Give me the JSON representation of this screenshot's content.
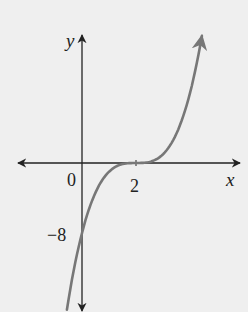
{
  "chart_data": {
    "type": "line",
    "title": "",
    "function": "y = (x - 2)^3",
    "xlabel": "x",
    "ylabel": "y",
    "x_ticks": [
      {
        "value": 2,
        "label": "2"
      }
    ],
    "y_ticks": [
      {
        "value": -8,
        "label": "−8"
      }
    ],
    "origin_label": "0",
    "xlim": [
      -2.4,
      5.9
    ],
    "ylim": [
      -17,
      14.5
    ],
    "grid": false,
    "legend": null,
    "key_points": [
      {
        "x": 0,
        "y": -8,
        "note": "y-intercept"
      },
      {
        "x": 2,
        "y": 0,
        "note": "stationary point of inflection"
      }
    ],
    "series": [
      {
        "name": "curve",
        "color": "#777777",
        "x": [
          -0.56,
          0,
          0.5,
          1,
          1.5,
          2,
          2.5,
          3,
          3.5,
          4,
          4.44
        ],
        "y": [
          -16.8,
          -8,
          -3.375,
          -1,
          -0.125,
          0,
          0.125,
          1,
          3.375,
          8,
          14.5
        ]
      }
    ]
  },
  "colors": {
    "axis": "#222222",
    "curve": "#777777",
    "background": "#efefef"
  }
}
